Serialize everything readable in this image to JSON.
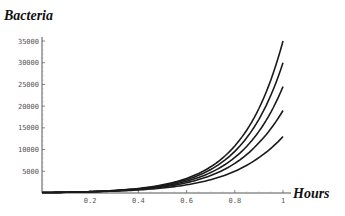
{
  "chart_data": {
    "type": "line",
    "title": "",
    "xlabel": "Hours",
    "ylabel": "Bacteria",
    "xlim": [
      0,
      1
    ],
    "ylim": [
      0,
      35000
    ],
    "x_ticks": [
      0.2,
      0.4,
      0.6,
      0.8,
      1
    ],
    "x_tick_labels": [
      "0.2",
      "0.4",
      "0.6",
      "0.8",
      "1"
    ],
    "y_ticks": [
      5000,
      10000,
      15000,
      20000,
      25000,
      30000,
      35000
    ],
    "y_tick_labels": [
      "5000",
      "10000",
      "15000",
      "20000",
      "25000",
      "30000",
      "35000"
    ],
    "grid": false,
    "legend": null,
    "x": [
      0,
      0.1,
      0.2,
      0.3,
      0.4,
      0.5,
      0.6,
      0.7,
      0.8,
      0.9,
      1.0
    ],
    "series": [
      {
        "name": "curve-1",
        "values": [
          100,
          180,
          323,
          580,
          1042,
          1871,
          3360,
          6034,
          10836,
          19460,
          35000
        ]
      },
      {
        "name": "curve-2",
        "values": [
          100,
          177,
          313,
          553,
          979,
          1732,
          3065,
          5422,
          9592,
          16968,
          30000
        ]
      },
      {
        "name": "curve-3",
        "values": [
          100,
          173,
          301,
          522,
          905,
          1569,
          2721,
          4718,
          8180,
          14183,
          24500
        ]
      },
      {
        "name": "curve-4",
        "values": [
          100,
          169,
          287,
          486,
          825,
          1399,
          2373,
          4025,
          6827,
          11578,
          19000
        ]
      },
      {
        "name": "curve-5",
        "values": [
          100,
          163,
          266,
          434,
          708,
          1154,
          1882,
          3069,
          5004,
          8160,
          13000
        ]
      }
    ]
  }
}
